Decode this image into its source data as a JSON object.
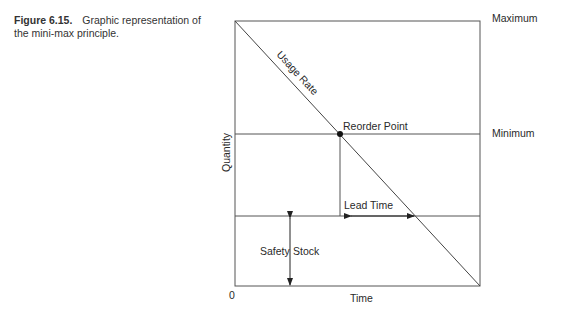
{
  "caption": {
    "figure_label": "Figure 6.15.",
    "text": "Graphic representation of the mini-max principle."
  },
  "diagram": {
    "labels": {
      "maximum": "Maximum",
      "minimum": "Minimum",
      "usage_rate": "Usage Rate",
      "reorder_point": "Reorder Point",
      "lead_time": "Lead Time",
      "safety_stock_left": "Safety",
      "safety_stock_right": "Stock",
      "y_axis": "Quantity",
      "x_axis": "Time",
      "origin": "0"
    },
    "levels": [
      "Maximum",
      "Minimum",
      "Safety Stock",
      "0"
    ],
    "annotations": [
      "Usage Rate",
      "Reorder Point",
      "Lead Time",
      "Safety Stock"
    ]
  }
}
